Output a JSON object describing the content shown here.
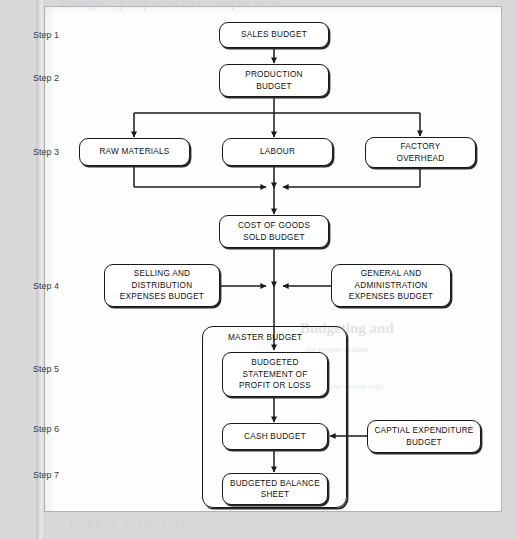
{
  "page": {
    "bleed_top": "budget preparation sequence",
    "bleed_heading": "Budgeting and",
    "bleed_sub": "the master budget",
    "bleed_line": "a note on the reverse page",
    "bleed_bottom": "budget preparation"
  },
  "steps": [
    {
      "label": "Step 1",
      "x": 33,
      "y": 30
    },
    {
      "label": "Step 2",
      "x": 33,
      "y": 73
    },
    {
      "label": "Step 3",
      "x": 33,
      "y": 147
    },
    {
      "label": "Step 4",
      "x": 33,
      "y": 281
    },
    {
      "label": "Step 5",
      "x": 33,
      "y": 364
    },
    {
      "label": "Step 6",
      "x": 33,
      "y": 424
    },
    {
      "label": "Step 7",
      "x": 33,
      "y": 470
    }
  ],
  "container": {
    "name": "MASTER BUDGET",
    "label_text": "MASTER       BUDGET",
    "x": 202,
    "y": 326,
    "w": 145,
    "h": 182,
    "label_x": 228,
    "label_y": 333
  },
  "nodes": [
    {
      "id": "sales",
      "text": "SALES BUDGET",
      "x": 219,
      "y": 22,
      "w": 110,
      "h": 26
    },
    {
      "id": "production",
      "text": "PRODUCTION\nBUDGET",
      "x": 219,
      "y": 64,
      "w": 110,
      "h": 33
    },
    {
      "id": "raw",
      "text": "RAW MATERIALS",
      "x": 79,
      "y": 138,
      "w": 111,
      "h": 28
    },
    {
      "id": "labour",
      "text": "LABOUR",
      "x": 222,
      "y": 138,
      "w": 111,
      "h": 28
    },
    {
      "id": "factory",
      "text": "FACTORY\nOVERHEAD",
      "x": 365,
      "y": 137,
      "w": 111,
      "h": 31
    },
    {
      "id": "cogs",
      "text": "COST OF GOODS\nSOLD BUDGET",
      "x": 219,
      "y": 215,
      "w": 110,
      "h": 33
    },
    {
      "id": "selling",
      "text": "SELLING AND\nDISTRIBUTION\nEXPENSES BUDGET",
      "x": 104,
      "y": 264,
      "w": 116,
      "h": 43
    },
    {
      "id": "general",
      "text": "GENERAL AND\nADMINISTRATION\nEXPENSES BUDGET",
      "x": 331,
      "y": 264,
      "w": 120,
      "h": 43
    },
    {
      "id": "profitloss",
      "text": "BUDGETED\nSTATEMENT OF\nPROFIT OR LOSS",
      "x": 222,
      "y": 352,
      "w": 106,
      "h": 45
    },
    {
      "id": "cash",
      "text": "CASH BUDGET",
      "x": 222,
      "y": 423,
      "w": 106,
      "h": 27
    },
    {
      "id": "balance",
      "text": "BUDGETED BALANCE\nSHEET",
      "x": 222,
      "y": 473,
      "w": 106,
      "h": 32
    },
    {
      "id": "capital",
      "text": "CAPTIAL EXPENDITURE\nBUDGET",
      "x": 367,
      "y": 420,
      "w": 114,
      "h": 33
    }
  ],
  "colors": {
    "line": "#1a1a1a",
    "page": "#fdfdfd",
    "surround": "#d8d8d8",
    "step_text": "#3c3c3c"
  }
}
